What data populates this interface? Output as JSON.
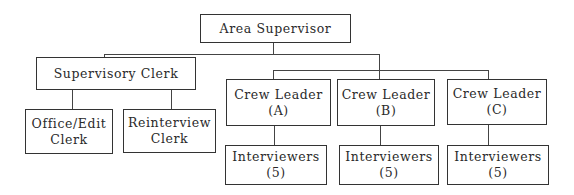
{
  "diagram": {
    "type": "org_chart",
    "root": {
      "id": "area-supervisor",
      "label": "Area Supervisor"
    },
    "supervisory_clerk": {
      "label": "Supervisory Clerk",
      "children": [
        {
          "line1": "Office/Edit",
          "line2": "Clerk"
        },
        {
          "line1": "Reinterview",
          "line2": "Clerk"
        }
      ]
    },
    "crew_leaders": [
      {
        "line1": "Crew Leader",
        "line2": "(A)",
        "child": {
          "line1": "Interviewers",
          "line2": "(5)"
        }
      },
      {
        "line1": "Crew Leader",
        "line2": "(B)",
        "child": {
          "line1": "Interviewers",
          "line2": "(5)"
        }
      },
      {
        "line1": "Crew Leader",
        "line2": "(C)",
        "child": {
          "line1": "Interviewers",
          "line2": "(5)"
        }
      }
    ],
    "colors": {
      "line": "#333333",
      "text": "#2a2a2a",
      "background": "#ffffff"
    }
  }
}
